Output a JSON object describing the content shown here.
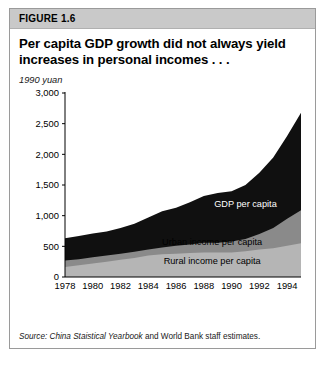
{
  "figure": {
    "number": "FIGURE 1.6",
    "title": "Per capita GDP growth did not always yield increases in personal incomes . . .",
    "units": "1990 yuan",
    "source_lead": "Source: China Staistical Yearbook",
    "source_rest": " and World Bank staff estimates."
  },
  "colors": {
    "header_band": "#c9c9c9",
    "card_border": "#9a9a9a",
    "gdp": "#101010",
    "urban": "#8a8a8a",
    "rural": "#b5b5b5",
    "axis": "#000000",
    "label_light": "#ffffff",
    "label_dark": "#000000"
  },
  "chart_data": {
    "type": "area",
    "title": "Per capita GDP growth did not always yield increases in personal incomes . . .",
    "xlabel": "",
    "ylabel": "1990 yuan",
    "ylim": [
      0,
      3000
    ],
    "xlim": [
      1978,
      1995
    ],
    "yticks": [
      0,
      500,
      1000,
      1500,
      2000,
      2500,
      3000
    ],
    "ytick_labels": [
      "0",
      "500",
      "1,000",
      "1,500",
      "2,000",
      "2,500",
      "3,000"
    ],
    "xticks": [
      1978,
      1980,
      1982,
      1984,
      1986,
      1988,
      1990,
      1992,
      1994
    ],
    "xtick_labels": [
      "1978",
      "1980",
      "1982",
      "1984",
      "1986",
      "1988",
      "1990",
      "1992",
      "1994"
    ],
    "grid": false,
    "legend": "inline-labels",
    "stacking": "overlaid-layers",
    "x": [
      1978,
      1979,
      1980,
      1981,
      1982,
      1983,
      1984,
      1985,
      1986,
      1987,
      1988,
      1989,
      1990,
      1991,
      1992,
      1993,
      1994,
      1995
    ],
    "series": [
      {
        "name": "GDP per capita",
        "color": "#101010",
        "label_color": "#ffffff",
        "values": [
          630,
          670,
          710,
          740,
          800,
          870,
          970,
          1070,
          1130,
          1220,
          1320,
          1370,
          1400,
          1500,
          1700,
          1950,
          2300,
          2680
        ]
      },
      {
        "name": "Urban income per capita",
        "color": "#8a8a8a",
        "label_color": "#000000",
        "values": [
          270,
          290,
          320,
          350,
          380,
          410,
          450,
          480,
          510,
          530,
          560,
          560,
          580,
          620,
          700,
          800,
          950,
          1090
        ]
      },
      {
        "name": "Rural income per capita",
        "color": "#b5b5b5",
        "label_color": "#000000",
        "values": [
          165,
          190,
          220,
          250,
          280,
          310,
          350,
          370,
          380,
          390,
          400,
          400,
          400,
          420,
          450,
          470,
          510,
          550
        ]
      }
    ]
  }
}
